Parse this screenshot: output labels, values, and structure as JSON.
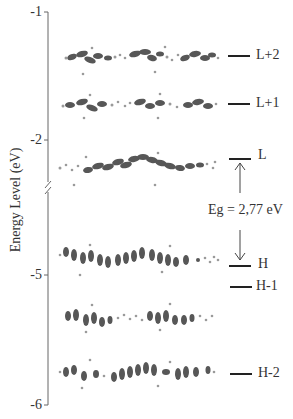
{
  "figure": {
    "ylabel": "Energy Level (eV)",
    "y_ticks": [
      {
        "label": "-1",
        "y": 12
      },
      {
        "label": "-2",
        "y": 140
      },
      {
        "label": "-5",
        "y": 275
      },
      {
        "label": "-6",
        "y": 405
      }
    ],
    "axis_break": {
      "between": [
        "-2",
        "-5"
      ]
    },
    "levels": [
      {
        "id": "L+2",
        "label": "L+2",
        "line_y": 56,
        "orbital": "lumo+2"
      },
      {
        "id": "L+1",
        "label": "L+1",
        "line_y": 104,
        "orbital": "lumo+1"
      },
      {
        "id": "L",
        "label": "L",
        "line_y": 158,
        "orbital": "lumo"
      },
      {
        "id": "H",
        "label": "H",
        "line_y": 237,
        "orbital": "homo"
      },
      {
        "id": "H-1",
        "label": "H-1",
        "line_y": 287,
        "orbital": "homo-1"
      },
      {
        "id": "H-2",
        "label": "H-2",
        "line_y": 374,
        "orbital": "homo-2"
      }
    ],
    "band_gap": {
      "label": "Eg = 2,77 eV"
    },
    "colors": {
      "axis": "#555555",
      "lobe": "#3a3a3a",
      "lobe_light": "#8a8a8a",
      "atom": "#9a9a9a"
    }
  }
}
